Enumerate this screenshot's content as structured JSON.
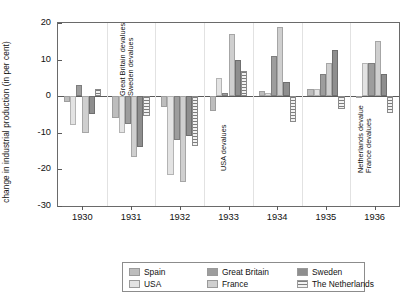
{
  "chart_data": {
    "type": "bar",
    "title": "",
    "xlabel": "",
    "ylabel": "change in industrial production (in per cent)",
    "ylim": [
      -30,
      20
    ],
    "yticks": [
      20,
      10,
      0,
      -10,
      -20,
      -30
    ],
    "ytick_labels": [
      "20",
      "10",
      "0",
      "-10",
      "-20",
      "-30"
    ],
    "grid": false,
    "legend_position": "bottom",
    "categories": [
      "1930",
      "1931",
      "1932",
      "1933",
      "1934",
      "1935",
      "1936"
    ],
    "series": [
      {
        "name": "Spain",
        "values": [
          -1.5,
          -6.0,
          -3.0,
          -4.0,
          1.5,
          2.0,
          0.0
        ]
      },
      {
        "name": "USA",
        "values": [
          -8.0,
          -10.0,
          -21.5,
          5.0,
          1.0,
          2.0,
          9.0
        ]
      },
      {
        "name": "Great Britain",
        "values": [
          3.0,
          -7.5,
          -12.0,
          1.0,
          11.0,
          6.0,
          9.0
        ]
      },
      {
        "name": "France",
        "values": [
          -10.0,
          -16.5,
          -23.5,
          17.0,
          19.0,
          9.0,
          15.0
        ]
      },
      {
        "name": "Sweden",
        "values": [
          -5.0,
          -14.0,
          -11.0,
          10.0,
          4.0,
          12.5,
          6.0
        ]
      },
      {
        "name": "The Netherlands",
        "values": [
          2.0,
          -5.5,
          -13.5,
          7.0,
          -7.0,
          -3.5,
          -4.5
        ]
      }
    ],
    "annotations": [
      {
        "text": "Great Britain devalues",
        "year": "1931"
      },
      {
        "text": "Sweden devalues",
        "year": "1931"
      },
      {
        "text": "USA devalues",
        "year": "1933"
      },
      {
        "text": "Netherlands devalue",
        "year": "1936"
      },
      {
        "text": "France devalues",
        "year": "1936"
      }
    ]
  },
  "legend": {
    "items": [
      {
        "label": "Spain",
        "swatch": "sw-spain"
      },
      {
        "label": "USA",
        "swatch": "sw-usa"
      },
      {
        "label": "Great Britain",
        "swatch": "sw-gb"
      },
      {
        "label": "France",
        "swatch": "sw-france"
      },
      {
        "label": "Sweden",
        "swatch": "sw-sweden"
      },
      {
        "label": "The Netherlands",
        "swatch": "sw-netherlands"
      }
    ]
  },
  "colors": {
    "spain": "#bdbdbd",
    "usa": "#e3e3e3",
    "great_britain": "#9d9d9d",
    "france": "#cfcfcf",
    "sweden": "#8e8e8e",
    "netherlands": "#7d7d7d",
    "axis": "#5a5a5a",
    "frame": "#6a6a6a"
  }
}
